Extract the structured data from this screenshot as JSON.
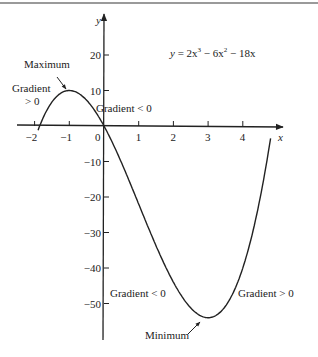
{
  "chart_data": {
    "type": "line",
    "title": "",
    "equation": "y = 2x^3 - 6x^2 - 18x",
    "equation_display": {
      "lhs": "y",
      "t1": "2x",
      "e1": "3",
      "t2": " − 6x",
      "e2": "2",
      "t3": " − 18x"
    },
    "xlabel": "x",
    "ylabel": "y",
    "xlim": [
      -2.0,
      5.0
    ],
    "ylim": [
      -60,
      30
    ],
    "x_ticks": [
      -2,
      -1,
      0,
      1,
      2,
      3,
      4
    ],
    "x_tick_labels": [
      "−2",
      "−1",
      "0",
      "1",
      "2",
      "3",
      "4"
    ],
    "y_ticks": [
      20,
      10,
      -10,
      -20,
      -30,
      -40,
      -50
    ],
    "y_tick_labels": [
      "20",
      "10",
      "−10",
      "−20",
      "−30",
      "−40",
      "−50"
    ],
    "series": [
      {
        "name": "y = 2x^3 - 6x^2 - 18x",
        "x": [
          -1.9,
          -1.5,
          -1,
          -0.5,
          0,
          0.5,
          1,
          1.5,
          2,
          2.5,
          3,
          3.5,
          4,
          4.5,
          4.8
        ],
        "y": [
          -5.9,
          6.8,
          10,
          7.3,
          0,
          -10.3,
          -22,
          -33.8,
          -44,
          -51.3,
          -54,
          -50.8,
          -40,
          -20.3,
          -0.5
        ]
      }
    ],
    "annotations": [
      {
        "text": "Maximum",
        "x": -1,
        "y": 10
      },
      {
        "text": "Minimum",
        "x": 3,
        "y": -54
      },
      {
        "text": "Gradient > 0",
        "region": "x < -1"
      },
      {
        "text": "Gradient < 0",
        "region": "-1 < x < 0"
      },
      {
        "text": "Gradient < 0",
        "region": "0 < x < 3"
      },
      {
        "text": "Gradient > 0",
        "region": "x > 3"
      }
    ],
    "grid": false,
    "legend": null
  },
  "labels": {
    "maximum": "Maximum",
    "minimum": "Minimum",
    "gradient_pos_left_1": "Gradient",
    "gradient_pos_left_2": "> 0",
    "gradient_neg_top": "Gradient  < 0",
    "gradient_neg_bottom": "Gradient  < 0",
    "gradient_pos_right": "Gradient  > 0"
  },
  "axes": {
    "x_name": "x",
    "y_name": "y"
  }
}
